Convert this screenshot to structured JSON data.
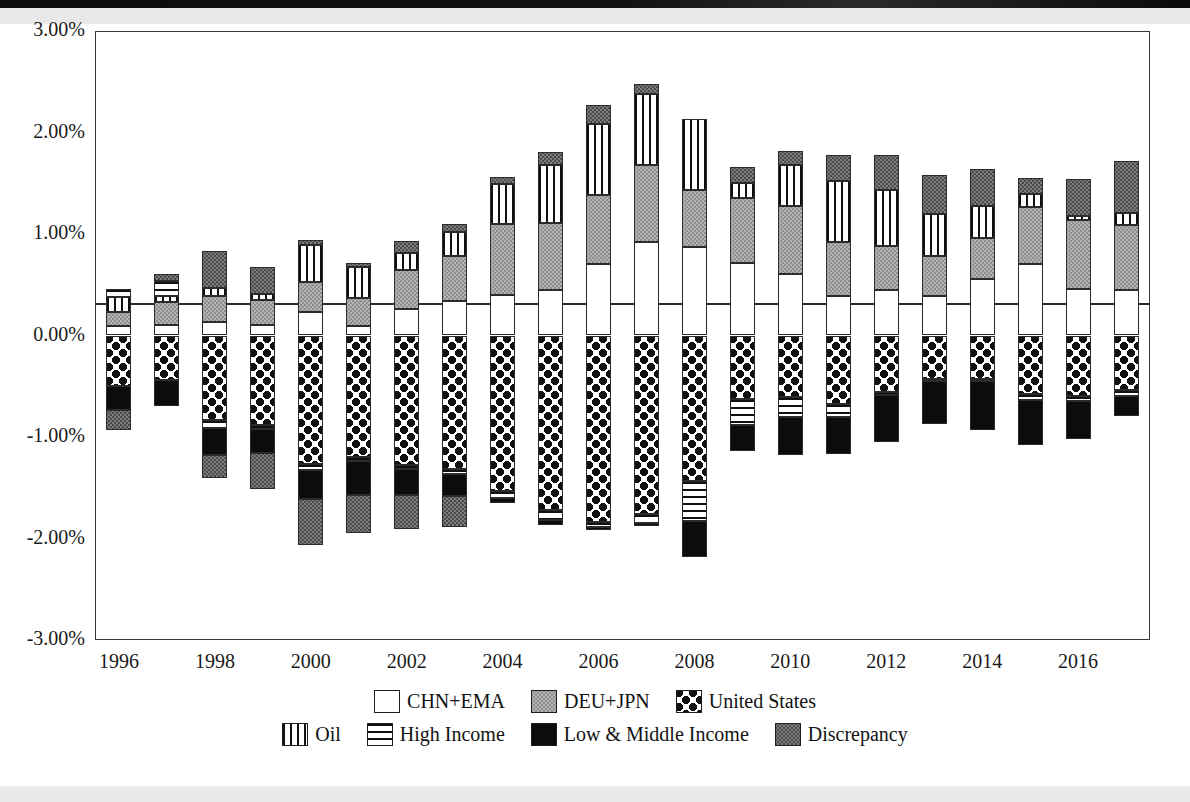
{
  "chart_data": {
    "type": "bar",
    "subtype": "stacked-bar-diverging",
    "title": "",
    "xlabel": "",
    "ylabel": "",
    "ylim": [
      -3.0,
      3.0
    ],
    "ytick_labels": [
      "3.00%",
      "2.00%",
      "1.00%",
      "0.00%",
      "-1.00%",
      "-2.00%",
      "-3.00%"
    ],
    "ytick_values": [
      3.0,
      2.0,
      1.0,
      0.0,
      -1.0,
      -2.0,
      -3.0
    ],
    "grid": false,
    "legend_position": "bottom",
    "x": [
      1996,
      1997,
      1998,
      1999,
      2000,
      2001,
      2002,
      2003,
      2004,
      2005,
      2006,
      2007,
      2008,
      2009,
      2010,
      2011,
      2012,
      2013,
      2014,
      2015,
      2016,
      2017
    ],
    "xtick_labels": [
      "1996",
      "1998",
      "2000",
      "2002",
      "2004",
      "2006",
      "2008",
      "2010",
      "2012",
      "2014",
      "2016"
    ],
    "xtick_values": [
      1996,
      1998,
      2000,
      2002,
      2004,
      2006,
      2008,
      2010,
      2012,
      2014,
      2016
    ],
    "units": "percent of world GDP",
    "series": [
      {
        "name": "CHN+EMA",
        "key": "chn",
        "fill": "white",
        "values": [
          0.09,
          0.1,
          0.13,
          0.1,
          0.23,
          0.09,
          0.26,
          0.34,
          0.4,
          0.45,
          0.7,
          0.92,
          0.87,
          0.71,
          0.61,
          0.39,
          0.45,
          0.39,
          0.56,
          0.7,
          0.46,
          0.45
        ]
      },
      {
        "name": "DEU+JPN",
        "key": "deu",
        "fill": "light-gray",
        "values": [
          0.14,
          0.23,
          0.26,
          0.25,
          0.3,
          0.28,
          0.39,
          0.44,
          0.7,
          0.66,
          0.68,
          0.76,
          0.56,
          0.64,
          0.67,
          0.53,
          0.43,
          0.39,
          0.4,
          0.57,
          0.68,
          0.64
        ]
      },
      {
        "name": "Oil",
        "key": "oil",
        "fill": "vertical-stripes",
        "values": [
          0.15,
          0.06,
          0.08,
          0.06,
          0.36,
          0.3,
          0.16,
          0.24,
          0.39,
          0.57,
          0.7,
          0.7,
          0.7,
          0.15,
          0.4,
          0.6,
          0.55,
          0.42,
          0.32,
          0.12,
          0.04,
          0.12
        ]
      },
      {
        "name": "High Income",
        "key": "high_pos",
        "fill": "horizontal-stripes",
        "values": [
          0.08,
          0.15,
          0.0,
          0.0,
          0.0,
          0.0,
          0.0,
          0.0,
          0.0,
          0.0,
          0.0,
          0.0,
          0.0,
          0.0,
          0.0,
          0.0,
          0.0,
          0.0,
          0.0,
          0.0,
          0.0,
          0.0
        ]
      },
      {
        "name": "Discrepancy",
        "key": "disc",
        "fill": "dark-gray",
        "values": [
          0.0,
          0.07,
          0.36,
          0.26,
          0.05,
          0.04,
          0.12,
          0.08,
          0.07,
          0.13,
          0.19,
          0.1,
          0.0,
          0.16,
          0.14,
          0.26,
          0.35,
          0.38,
          0.36,
          0.16,
          0.36,
          0.51
        ]
      },
      {
        "name": "United States",
        "key": "usa",
        "fill": "dotted",
        "sign": "negative",
        "values": [
          -0.5,
          -0.44,
          -0.83,
          -0.88,
          -1.27,
          -1.2,
          -1.28,
          -1.32,
          -1.53,
          -1.72,
          -1.84,
          -1.76,
          -1.43,
          -0.63,
          -0.61,
          -0.67,
          -0.56,
          -0.43,
          -0.43,
          -0.58,
          -0.6,
          -0.54
        ]
      },
      {
        "name": "High Income",
        "key": "high_neg",
        "fill": "horizontal-stripes",
        "sign": "negative",
        "values": [
          0.0,
          0.0,
          -0.08,
          -0.04,
          -0.06,
          -0.04,
          -0.04,
          -0.04,
          -0.07,
          -0.1,
          -0.05,
          -0.09,
          -0.4,
          -0.25,
          -0.19,
          -0.13,
          -0.03,
          -0.02,
          -0.02,
          -0.06,
          -0.05,
          -0.06
        ]
      },
      {
        "name": "Low & Middle Income",
        "key": "low",
        "fill": "black",
        "sign": "negative",
        "values": [
          -0.23,
          -0.25,
          -0.27,
          -0.24,
          -0.28,
          -0.33,
          -0.25,
          -0.22,
          -0.05,
          -0.05,
          -0.03,
          -0.03,
          -0.35,
          -0.26,
          -0.38,
          -0.37,
          -0.46,
          -0.42,
          -0.48,
          -0.44,
          -0.37,
          -0.19
        ]
      },
      {
        "name": "Discrepancy",
        "key": "disc_neg",
        "fill": "dark-gray",
        "sign": "negative",
        "values": [
          -0.2,
          0.0,
          -0.22,
          -0.35,
          -0.45,
          -0.38,
          -0.34,
          -0.31,
          0.0,
          0.0,
          0.0,
          0.0,
          0.0,
          0.0,
          0.0,
          0.0,
          0.0,
          0.0,
          0.0,
          0.0,
          0.0,
          0.0
        ]
      }
    ],
    "totals_positive": [
      0.46,
      0.61,
      0.83,
      0.67,
      0.94,
      0.71,
      0.93,
      1.1,
      1.56,
      1.81,
      2.27,
      2.48,
      2.13,
      1.66,
      1.82,
      1.78,
      1.78,
      1.58,
      1.64,
      1.55,
      1.54,
      1.72
    ],
    "totals_negative": [
      -0.93,
      -0.69,
      -1.4,
      -1.51,
      -2.06,
      -1.95,
      -1.91,
      -1.89,
      -1.65,
      -1.87,
      -1.92,
      -1.88,
      -2.18,
      -1.14,
      -1.18,
      -1.17,
      -1.05,
      -0.87,
      -0.93,
      -1.08,
      -1.02,
      -0.79
    ]
  },
  "legend": {
    "row1": [
      {
        "label": "CHN+EMA",
        "swatch": "white"
      },
      {
        "label": "DEU+JPN",
        "swatch": "light-gray"
      },
      {
        "label": "United States",
        "swatch": "dotted"
      }
    ],
    "row2": [
      {
        "label": "Oil",
        "swatch": "vertical-stripes"
      },
      {
        "label": "High Income",
        "swatch": "horizontal-stripes"
      },
      {
        "label": "Low & Middle Income",
        "swatch": "black"
      },
      {
        "label": "Discrepancy",
        "swatch": "dark-gray"
      }
    ]
  },
  "colors": {
    "axis": "#2a2a2a",
    "frame": "#3a3a3a",
    "text": "#1a1a1a",
    "light_gray": "#b4b4b4",
    "dark_gray": "#7d7d7d",
    "black": "#0c0c0c",
    "white": "#ffffff"
  }
}
